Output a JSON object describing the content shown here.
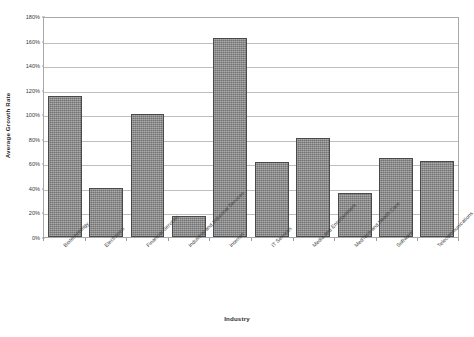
{
  "chart_data": {
    "type": "bar",
    "title": "",
    "xlabel": "Industry",
    "ylabel": "Average Growth Rate",
    "ylim": [
      0,
      180
    ],
    "ytick_step": 20,
    "ytick_labels": [
      "0%",
      "20%",
      "40%",
      "60%",
      "80%",
      "100%",
      "120%",
      "140%",
      "160%",
      "180%"
    ],
    "ytick_values": [
      0,
      20,
      40,
      60,
      80,
      100,
      120,
      140,
      160,
      180
    ],
    "grid": true,
    "legend": false,
    "value_unit": "percent",
    "orientation": "vertical",
    "categories": [
      "Biotechnology",
      "Electronics",
      "Financial Services",
      "Industrial and Industrial Services",
      "Internet",
      "IT Services",
      "Media and Entertainment",
      "MedTech and Health Care",
      "Software",
      "Telecommunications"
    ],
    "values": [
      115,
      40,
      100,
      17,
      162,
      61,
      81,
      36,
      64,
      62
    ],
    "bar_fill_color": "#8b8b8b",
    "bar_edge_color": "#4a4a4a",
    "gridline_color": "#bfbfbf",
    "frame_color": "#a8a8a8",
    "background_color": "#ffffff"
  }
}
